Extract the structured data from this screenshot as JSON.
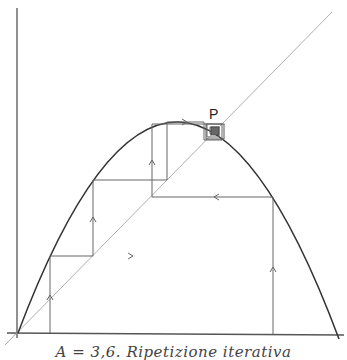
{
  "figure": {
    "point_label": "P",
    "caption": "A = 3,6. Ripetizione iterativa",
    "colors": {
      "curve": "#333333",
      "axes": "#555555",
      "diagonal": "#a8a8a8",
      "cobweb": "#666666"
    },
    "parameter_A": 3.6,
    "elements": [
      "axes",
      "parabola",
      "diagonal y=x",
      "cobweb iterations",
      "fixed point P"
    ]
  }
}
